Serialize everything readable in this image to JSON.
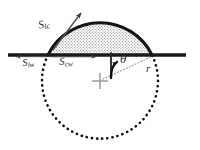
{
  "figure": {
    "background_color": "#ffffff",
    "stroke_color": "#1a1a1a",
    "fill_pattern": "stippled-dots",
    "fill_color": "#8f8f8f",
    "width": 200,
    "height": 150
  },
  "labels": {
    "liquid_cap": {
      "symbol": "S",
      "subscript": "lc"
    },
    "liquid_wall": {
      "symbol": "S",
      "subscript": "lw"
    },
    "cap_wall": {
      "symbol": "S",
      "subscript": "cw"
    },
    "angle": {
      "symbol": "θ"
    },
    "radius": {
      "symbol": "r"
    }
  },
  "geometry": {
    "baseline_y": 55,
    "baseline_x_start": 8,
    "baseline_x_end": 186,
    "circle_center_x": 100,
    "circle_center_y": 81,
    "circle_radius": 58,
    "cap_left_x": 48,
    "cap_right_x": 152,
    "cap_apex_y": 23,
    "contact_angle_degrees": 63
  },
  "arrows": {
    "liquid_cap_arrow": {
      "direction": "up-right",
      "from_x": 48,
      "from_y": 55,
      "to_x": 82,
      "to_y": 12
    },
    "liquid_wall_arrow": {
      "direction": "left",
      "from_x": 48,
      "from_y": 55,
      "to_x": 14,
      "to_y": 55
    },
    "cap_wall_arrow": {
      "direction": "right",
      "from_x": 48,
      "from_y": 55,
      "to_x": 99,
      "to_y": 55
    },
    "angle_arc_arrow": {
      "direction": "clockwise-sweep"
    }
  }
}
